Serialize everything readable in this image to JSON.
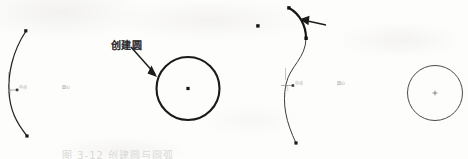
{
  "figure": {
    "caption": "图 3-12   创建圆与圆弧",
    "panels": [
      {
        "id": "left",
        "annotation": "创建圆",
        "elements": {
          "arc_label_radius": "R25",
          "arc_label_angle": "120",
          "midpoint_label": "中点",
          "center_label": "圆心"
        }
      },
      {
        "id": "right",
        "annotation": "创建圆弧",
        "elements": {
          "arc_label_radius": "R25",
          "arc_label_angle": "120",
          "midpoint_label": "中点",
          "center_label": "圆心"
        }
      }
    ]
  },
  "colors": {
    "ink": "#1c1c1c",
    "thin_ink": "#4a4a4a",
    "paper": "#fdfdfc",
    "faded": "#9a9a96"
  }
}
